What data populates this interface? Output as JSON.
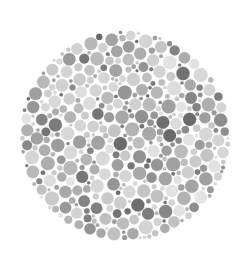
{
  "image": {
    "kind": "ishihara-plate",
    "title": "Ishihara Color Vision Test Plate (Grayscale)",
    "caption": "",
    "width": 250,
    "height": 261,
    "background_color": "#ffffff"
  },
  "plate": {
    "shape": "circle",
    "center_x": 125,
    "center_y": 136,
    "radius": 107,
    "bounds": {
      "left": 18,
      "top": 24,
      "right": 232,
      "bottom": 248
    },
    "hidden_figure_visible": false,
    "hidden_figure_reading": "",
    "fill_style": "packed-dots"
  },
  "dots": {
    "count_target": 1150,
    "min_radius": 1.5,
    "max_radius": 6.6,
    "gap": 0.55,
    "edge_inset": 1.5,
    "size_weights": [
      {
        "radius": 1.8,
        "weight": 26
      },
      {
        "radius": 2.5,
        "weight": 24
      },
      {
        "radius": 3.3,
        "weight": 20
      },
      {
        "radius": 4.2,
        "weight": 15
      },
      {
        "radius": 5.2,
        "weight": 10
      },
      {
        "radius": 6.3,
        "weight": 5
      }
    ],
    "palette": [
      {
        "name": "light-gray",
        "hex": "#dcdcdc",
        "weight": 15
      },
      {
        "name": "pale-gray",
        "hex": "#d0d0d0",
        "weight": 14
      },
      {
        "name": "soft-gray",
        "hex": "#c2c2c2",
        "weight": 14
      },
      {
        "name": "mid-light-gray",
        "hex": "#b4b4b4",
        "weight": 13
      },
      {
        "name": "mid-gray",
        "hex": "#a6a6a6",
        "weight": 13
      },
      {
        "name": "mid-dark-gray",
        "hex": "#999999",
        "weight": 11
      },
      {
        "name": "dark-gray",
        "hex": "#8a8a8a",
        "weight": 9
      },
      {
        "name": "deep-gray",
        "hex": "#7c7c7c",
        "weight": 7
      },
      {
        "name": "charcoal-gray",
        "hex": "#6e6e6e",
        "weight": 4
      }
    ],
    "tone_jitter": 9,
    "seed": 20240617
  }
}
